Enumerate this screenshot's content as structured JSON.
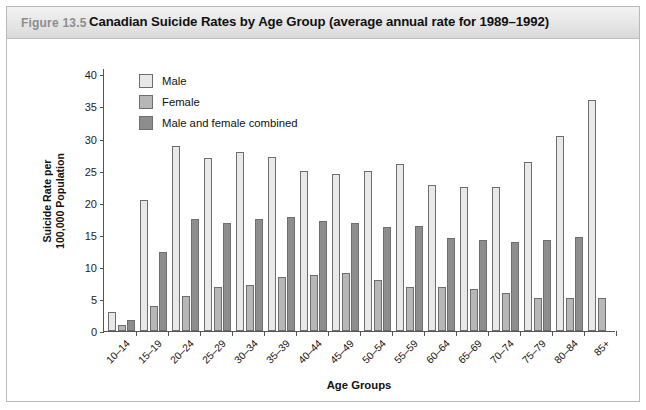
{
  "figure": {
    "number": "Figure 13.5",
    "title": "Canadian Suicide Rates by Age Group (average annual rate for 1989–1992)"
  },
  "legend": [
    {
      "label": "Male",
      "color": "#e8e8e8",
      "key": "male"
    },
    {
      "label": "Female",
      "color": "#b7b7b7",
      "key": "female"
    },
    {
      "label": "Male and female combined",
      "color": "#8d8d8d",
      "key": "combined"
    }
  ],
  "axes": {
    "ylabel_line1": "Suicide Rate per",
    "ylabel_line2": "100,000 Population",
    "xlabel": "Age Groups",
    "yticks": [
      "0",
      "5",
      "10",
      "15",
      "20",
      "25",
      "30",
      "35",
      "40"
    ]
  },
  "chart_data": {
    "type": "bar",
    "title": "Canadian Suicide Rates by Age Group (average annual rate for 1989–1992)",
    "xlabel": "Age Groups",
    "ylabel": "Suicide Rate per 100,000 Population",
    "ylim": [
      0,
      41
    ],
    "yticks": [
      0,
      5,
      10,
      15,
      20,
      25,
      30,
      35,
      40
    ],
    "grid": false,
    "legend_position": "top-left",
    "categories": [
      "10–14",
      "15–19",
      "20–24",
      "25–29",
      "30–34",
      "35–39",
      "40–44",
      "45–49",
      "50–54",
      "55–59",
      "60–64",
      "65–69",
      "70–74",
      "75–79",
      "80–84",
      "85+"
    ],
    "series": [
      {
        "name": "Male",
        "color": "#e8e8e8",
        "values": [
          2.9,
          20.5,
          28.9,
          26.9,
          27.9,
          27.1,
          24.9,
          24.5,
          24.9,
          26.0,
          22.8,
          22.5,
          22.4,
          26.3,
          30.4,
          36.0
        ]
      },
      {
        "name": "Female",
        "color": "#b7b7b7",
        "values": [
          0.9,
          3.9,
          5.5,
          6.9,
          7.2,
          8.4,
          8.7,
          9.0,
          8.0,
          6.9,
          6.8,
          6.6,
          6.0,
          5.2,
          5.1,
          5.2
        ]
      },
      {
        "name": "Male and female combined",
        "color": "#8d8d8d",
        "values": [
          1.7,
          12.3,
          17.4,
          16.9,
          17.4,
          17.7,
          17.2,
          16.9,
          16.2,
          16.3,
          14.5,
          14.2,
          13.8,
          14.2,
          14.6,
          null
        ]
      }
    ]
  }
}
